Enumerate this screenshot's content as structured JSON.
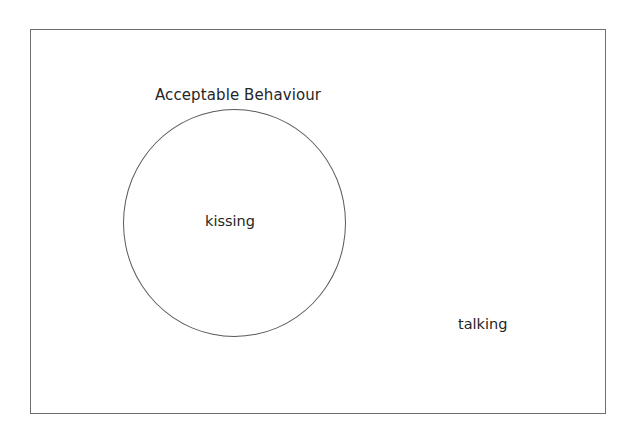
{
  "diagram": {
    "type": "venn",
    "universe": {
      "label": ""
    },
    "set": {
      "title": "Acceptable Behaviour",
      "items": [
        {
          "label": "kissing"
        }
      ]
    },
    "outside_items": [
      {
        "label": "talking"
      }
    ],
    "colors": {
      "stroke": "#5a5a5a",
      "text": "#262626",
      "background": "#ffffff"
    }
  }
}
